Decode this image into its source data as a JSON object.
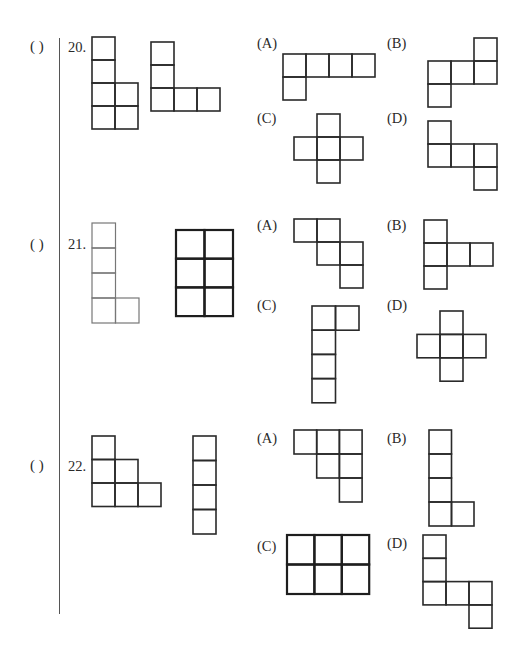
{
  "problems": [
    {
      "number": "20.",
      "answer_blank": "(    )",
      "given_shapes": [
        {
          "name": "given-shape-20a",
          "x": 92,
          "y": 37,
          "cw": 23,
          "ch": 23,
          "stroke": "#2a2a2a",
          "sw": 1.6,
          "cells": [
            [
              0,
              0
            ],
            [
              0,
              1
            ],
            [
              0,
              2
            ],
            [
              1,
              2
            ],
            [
              0,
              3
            ],
            [
              1,
              3
            ]
          ]
        },
        {
          "name": "given-shape-20b",
          "x": 151,
          "y": 42,
          "cw": 23,
          "ch": 23,
          "stroke": "#2a2a2a",
          "sw": 1.6,
          "cells": [
            [
              0,
              0
            ],
            [
              0,
              1
            ],
            [
              0,
              2
            ],
            [
              1,
              2
            ],
            [
              2,
              2
            ]
          ]
        }
      ],
      "options": [
        {
          "label": "(A)",
          "lx": 257,
          "ly": 35,
          "shape": {
            "x": 283,
            "y": 54,
            "cw": 23,
            "ch": 23,
            "stroke": "#2a2a2a",
            "sw": 1.6,
            "cells": [
              [
                0,
                0
              ],
              [
                1,
                0
              ],
              [
                2,
                0
              ],
              [
                3,
                0
              ],
              [
                0,
                1
              ]
            ]
          }
        },
        {
          "label": "(B)",
          "lx": 387,
          "ly": 35,
          "shape": {
            "x": 428,
            "y": 38,
            "cw": 23,
            "ch": 23,
            "stroke": "#2a2a2a",
            "sw": 1.6,
            "cells": [
              [
                2,
                0
              ],
              [
                0,
                1
              ],
              [
                1,
                1
              ],
              [
                2,
                1
              ],
              [
                0,
                2
              ]
            ]
          }
        },
        {
          "label": "(C)",
          "lx": 257,
          "ly": 110,
          "shape": {
            "x": 294,
            "y": 114,
            "cw": 23,
            "ch": 23,
            "stroke": "#2a2a2a",
            "sw": 1.6,
            "cells": [
              [
                1,
                0
              ],
              [
                0,
                1
              ],
              [
                1,
                1
              ],
              [
                2,
                1
              ],
              [
                1,
                2
              ]
            ]
          }
        },
        {
          "label": "(D)",
          "lx": 387,
          "ly": 110,
          "shape": {
            "x": 428,
            "y": 121,
            "cw": 23,
            "ch": 23,
            "stroke": "#2a2a2a",
            "sw": 1.6,
            "cells": [
              [
                0,
                0
              ],
              [
                0,
                1
              ],
              [
                1,
                1
              ],
              [
                2,
                1
              ],
              [
                2,
                2
              ]
            ]
          }
        }
      ]
    },
    {
      "number": "21.",
      "answer_blank": "(    )",
      "given_shapes": [
        {
          "name": "given-shape-21a",
          "x": 92,
          "y": 223,
          "cw": 23.5,
          "ch": 25,
          "stroke": "#777777",
          "sw": 1.2,
          "cells": [
            [
              0,
              0
            ],
            [
              0,
              1
            ],
            [
              0,
              2
            ],
            [
              0,
              3
            ],
            [
              1,
              3
            ]
          ]
        },
        {
          "name": "given-shape-21b",
          "x": 176,
          "y": 230,
          "cw": 28.5,
          "ch": 28.7,
          "stroke": "#1e1e1e",
          "sw": 2.2,
          "cells": [
            [
              0,
              0
            ],
            [
              1,
              0
            ],
            [
              0,
              1
            ],
            [
              1,
              1
            ],
            [
              0,
              2
            ],
            [
              1,
              2
            ]
          ]
        }
      ],
      "options": [
        {
          "label": "(A)",
          "lx": 257,
          "ly": 217,
          "shape": {
            "x": 294,
            "y": 219,
            "cw": 23,
            "ch": 23,
            "stroke": "#2a2a2a",
            "sw": 1.6,
            "cells": [
              [
                0,
                0
              ],
              [
                1,
                0
              ],
              [
                1,
                1
              ],
              [
                2,
                1
              ],
              [
                2,
                2
              ]
            ]
          }
        },
        {
          "label": "(B)",
          "lx": 387,
          "ly": 217,
          "shape": {
            "x": 424,
            "y": 220,
            "cw": 23,
            "ch": 23,
            "stroke": "#2a2a2a",
            "sw": 1.6,
            "cells": [
              [
                0,
                0
              ],
              [
                0,
                1
              ],
              [
                1,
                1
              ],
              [
                2,
                1
              ],
              [
                0,
                2
              ]
            ]
          }
        },
        {
          "label": "(C)",
          "lx": 257,
          "ly": 297,
          "shape": {
            "x": 312,
            "y": 306,
            "cw": 23.5,
            "ch": 24.2,
            "stroke": "#2a2a2a",
            "sw": 1.6,
            "cells": [
              [
                0,
                0
              ],
              [
                1,
                0
              ],
              [
                0,
                1
              ],
              [
                0,
                2
              ],
              [
                0,
                3
              ]
            ]
          }
        },
        {
          "label": "(D)",
          "lx": 387,
          "ly": 297,
          "shape": {
            "x": 417,
            "y": 311,
            "cw": 23,
            "ch": 23.4,
            "stroke": "#2a2a2a",
            "sw": 1.6,
            "cells": [
              [
                1,
                0
              ],
              [
                0,
                1
              ],
              [
                1,
                1
              ],
              [
                2,
                1
              ],
              [
                1,
                2
              ]
            ]
          }
        }
      ]
    },
    {
      "number": "22.",
      "answer_blank": "(    )",
      "given_shapes": [
        {
          "name": "given-shape-22a",
          "x": 92,
          "y": 436,
          "cw": 23,
          "ch": 23.5,
          "stroke": "#2a2a2a",
          "sw": 1.6,
          "cells": [
            [
              0,
              0
            ],
            [
              0,
              1
            ],
            [
              1,
              1
            ],
            [
              0,
              2
            ],
            [
              1,
              2
            ],
            [
              2,
              2
            ]
          ]
        },
        {
          "name": "given-shape-22b",
          "x": 193,
          "y": 436,
          "cw": 23,
          "ch": 24.5,
          "stroke": "#2a2a2a",
          "sw": 1.6,
          "cells": [
            [
              0,
              0
            ],
            [
              0,
              1
            ],
            [
              0,
              2
            ],
            [
              0,
              3
            ]
          ]
        }
      ],
      "options": [
        {
          "label": "(A)",
          "lx": 257,
          "ly": 430,
          "shape": {
            "x": 294,
            "y": 430,
            "cw": 22.7,
            "ch": 24,
            "stroke": "#2a2a2a",
            "sw": 1.6,
            "cells": [
              [
                0,
                0
              ],
              [
                1,
                0
              ],
              [
                2,
                0
              ],
              [
                1,
                1
              ],
              [
                2,
                1
              ],
              [
                2,
                2
              ]
            ]
          }
        },
        {
          "label": "(B)",
          "lx": 387,
          "ly": 430,
          "shape": {
            "x": 429,
            "y": 430,
            "cw": 22.5,
            "ch": 24,
            "stroke": "#2a2a2a",
            "sw": 1.6,
            "cells": [
              [
                0,
                0
              ],
              [
                0,
                1
              ],
              [
                0,
                2
              ],
              [
                0,
                3
              ],
              [
                1,
                3
              ]
            ]
          }
        },
        {
          "label": "(C)",
          "lx": 257,
          "ly": 538,
          "shape": {
            "x": 287,
            "y": 535,
            "cw": 27.4,
            "ch": 29.5,
            "stroke": "#1e1e1e",
            "sw": 2.2,
            "cells": [
              [
                0,
                0
              ],
              [
                1,
                0
              ],
              [
                2,
                0
              ],
              [
                0,
                1
              ],
              [
                1,
                1
              ],
              [
                2,
                1
              ]
            ]
          }
        },
        {
          "label": "(D)",
          "lx": 387,
          "ly": 535,
          "shape": {
            "x": 423,
            "y": 535,
            "cw": 23,
            "ch": 23.3,
            "stroke": "#2a2a2a",
            "sw": 1.6,
            "cells": [
              [
                0,
                0
              ],
              [
                0,
                1
              ],
              [
                0,
                2
              ],
              [
                1,
                2
              ],
              [
                2,
                2
              ],
              [
                2,
                3
              ]
            ]
          }
        }
      ]
    }
  ],
  "layout": {
    "rows_y": {
      "20": 38,
      "21": 236,
      "22": 432
    },
    "paren_x": 30,
    "number_x": 68
  }
}
